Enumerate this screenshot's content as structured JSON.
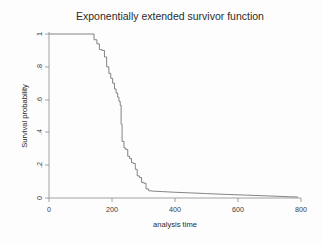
{
  "chart_data": {
    "type": "line",
    "title": "Exponentially extended survivor function",
    "xlabel": "analysis time",
    "ylabel": "Survival probability",
    "xlim": [
      0,
      800
    ],
    "ylim": [
      0,
      1
    ],
    "grid": false,
    "legend": null,
    "xticks": [
      0,
      200,
      400,
      600,
      800
    ],
    "xticklabels": [
      "0",
      "200",
      "400",
      "600",
      "800"
    ],
    "yticks": [
      0,
      0.2,
      0.4,
      0.6,
      0.8,
      1
    ],
    "yticklabels": [
      "0",
      ".2",
      ".4",
      ".6",
      ".8",
      "1"
    ],
    "series": [
      {
        "name": "survivor function",
        "style": "step-post-then-smooth-tail",
        "color": "#6e6e6e",
        "x": [
          0,
          143,
          143,
          152,
          152,
          160,
          160,
          168,
          168,
          176,
          176,
          183,
          183,
          190,
          190,
          196,
          196,
          202,
          202,
          208,
          208,
          213,
          213,
          218,
          218,
          222,
          222,
          226,
          226,
          229,
          229,
          232,
          232,
          238,
          238,
          244,
          244,
          250,
          250,
          256,
          256,
          262,
          262,
          268,
          268,
          274,
          274,
          280,
          280,
          287,
          287,
          294,
          294,
          301,
          301,
          308,
          308,
          316,
          316,
          330,
          360,
          400,
          450,
          500,
          560,
          620,
          690,
          760,
          790
        ],
        "y": [
          1.0,
          1.0,
          0.965,
          0.965,
          0.94,
          0.94,
          0.905,
          0.905,
          0.9,
          0.9,
          0.86,
          0.86,
          0.8,
          0.8,
          0.76,
          0.76,
          0.73,
          0.73,
          0.7,
          0.7,
          0.665,
          0.665,
          0.64,
          0.64,
          0.615,
          0.615,
          0.59,
          0.59,
          0.565,
          0.565,
          0.45,
          0.45,
          0.345,
          0.345,
          0.305,
          0.305,
          0.295,
          0.295,
          0.255,
          0.255,
          0.24,
          0.24,
          0.215,
          0.215,
          0.21,
          0.21,
          0.175,
          0.175,
          0.135,
          0.135,
          0.125,
          0.125,
          0.095,
          0.095,
          0.09,
          0.09,
          0.055,
          0.055,
          0.045,
          0.042,
          0.039,
          0.035,
          0.031,
          0.027,
          0.022,
          0.018,
          0.013,
          0.008,
          0.006
        ]
      }
    ]
  }
}
